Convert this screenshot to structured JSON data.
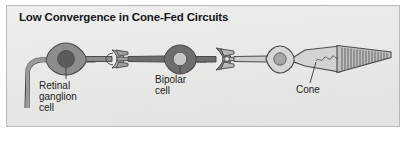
{
  "figure": {
    "title": "Low Convergence in Cone-Fed Circuits",
    "panel_background": "#e9e9e7",
    "panel_border": "#b9b9b5",
    "page_background": "#ffffff"
  },
  "diagram": {
    "type": "retinal-circuit-schematic",
    "flow_direction": "right-to-left",
    "labels": [
      {
        "id": "retinal-ganglion-cell",
        "text": "Retinal\nganglion\ncell",
        "leader_line": true
      },
      {
        "id": "bipolar-cell",
        "text": "Bipolar\ncell",
        "leader_line": true
      },
      {
        "id": "cone",
        "text": "Cone",
        "leader_line": true
      }
    ],
    "cells": [
      {
        "id": "retinal-ganglion-cell",
        "soma_fill": "#8d8d8d",
        "nucleus_fill": "#5b5b5b",
        "outline": "#4a4a4a",
        "has_axon": true
      },
      {
        "id": "bipolar-cell",
        "soma_fill": "#6e6e6e",
        "nucleus_fill": "#c6c6c4",
        "outline": "#4a4a4a",
        "has_axon": false
      },
      {
        "id": "cone",
        "soma_fill": "#d6d6d3",
        "nucleus_fill": "#a6a6a4",
        "outline": "#4a4a4a",
        "outer_segment_lamellae": 20
      }
    ],
    "synapses": [
      {
        "id": "bipolar-to-ganglion-synapse",
        "shape": "claw-terminal"
      },
      {
        "id": "cone-to-bipolar-synapse",
        "shape": "claw-terminal"
      }
    ]
  }
}
